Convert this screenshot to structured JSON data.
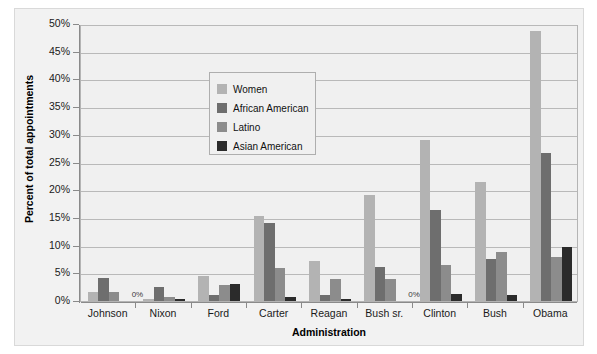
{
  "chart_data": {
    "type": "bar",
    "title": "",
    "xlabel": "Administration",
    "ylabel": "Percent of total appointments",
    "ylim": [
      0,
      50
    ],
    "ytick_labels": [
      "0%",
      "5%",
      "10%",
      "15%",
      "20%",
      "25%",
      "30%",
      "35%",
      "40%",
      "45%",
      "50%"
    ],
    "ytick_values": [
      0,
      5,
      10,
      15,
      20,
      25,
      30,
      35,
      40,
      45,
      50
    ],
    "grid": true,
    "legend_position": "upper-left-inside",
    "categories": [
      "Johnson",
      "Nixon",
      "Ford",
      "Carter",
      "Reagan",
      "Bush sr.",
      "Clinton",
      "Bush",
      "Obama"
    ],
    "series": [
      {
        "name": "Women",
        "color": "#b3b3b3",
        "values": [
          1.6,
          0.3,
          4.5,
          15.4,
          7.3,
          19.1,
          29.0,
          21.4,
          48.8
        ]
      },
      {
        "name": "African American",
        "color": "#6e6e6e",
        "values": [
          4.1,
          2.5,
          1.0,
          14.0,
          1.0,
          6.1,
          16.5,
          7.6,
          26.8
        ]
      },
      {
        "name": "Latino",
        "color": "#8c8c8c",
        "values": [
          1.7,
          0.7,
          2.9,
          6.0,
          4.0,
          4.0,
          6.5,
          8.9,
          8.0
        ]
      },
      {
        "name": "Asian American",
        "color": "#2b2b2b",
        "values": [
          0.0,
          0.3,
          3.0,
          0.8,
          0.3,
          0.0,
          1.2,
          1.0,
          9.8
        ]
      }
    ],
    "point_labels": [
      {
        "category": "Johnson",
        "series": "Asian American",
        "text": "0%"
      },
      {
        "category": "Bush sr.",
        "series": "Asian American",
        "text": "0%"
      }
    ]
  }
}
